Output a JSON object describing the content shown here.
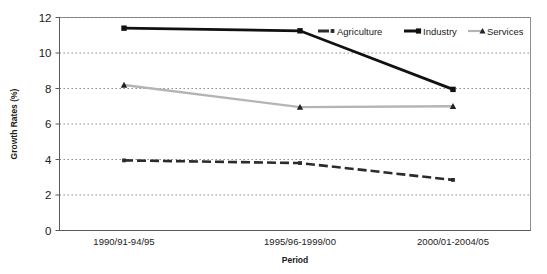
{
  "chart_data": {
    "type": "line",
    "title": "",
    "xlabel": "Period",
    "ylabel": "Growth Rates (%)",
    "categories": [
      "1990/91-94/95",
      "1995/96-1999/00",
      "2000/01-2004/05"
    ],
    "ylim": [
      0,
      12
    ],
    "ytick_labels": [
      "0",
      "2",
      "4",
      "6",
      "8",
      "10",
      "12"
    ],
    "ytick_values": [
      0,
      2,
      4,
      6,
      8,
      10,
      12
    ],
    "grid": "horizontal-dotted",
    "legend_position": "top-right-inside",
    "series": [
      {
        "name": "Agriculture",
        "values": [
          3.95,
          3.8,
          2.85
        ],
        "color": "#2b2b2b",
        "line_style": "dashed",
        "marker": "square-small"
      },
      {
        "name": "Industry",
        "values": [
          11.4,
          11.25,
          7.95
        ],
        "color": "#111111",
        "line_style": "solid",
        "marker": "square"
      },
      {
        "name": "Services",
        "values": [
          8.2,
          6.95,
          7.0
        ],
        "color": "#b4b4b4",
        "line_style": "solid",
        "marker": "triangle"
      }
    ]
  },
  "legend": {
    "items": [
      {
        "label": "Agriculture"
      },
      {
        "label": "Industry"
      },
      {
        "label": "Services"
      }
    ]
  },
  "axes": {
    "y_title": "Growth Rates (%)",
    "x_title": "Period"
  },
  "colors": {
    "agriculture": "#2b2b2b",
    "industry": "#111111",
    "services": "#b4b4b4",
    "grid": "#6f6f6f",
    "frame": "#8e8e8e",
    "text": "#1b1b1b"
  }
}
